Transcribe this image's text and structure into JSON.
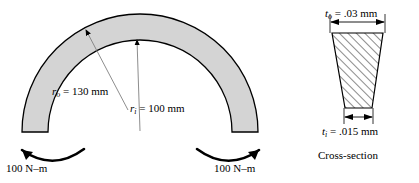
{
  "figure": {
    "colors": {
      "beam_fill": "#d4d4d4",
      "outline": "#000000",
      "leader_line": "#808080",
      "hatch": "#000000"
    }
  },
  "beam": {
    "outer_radius_label": {
      "symbol": "r",
      "subscript": "o",
      "value": "130",
      "unit": "mm",
      "text": "r_o = 130 mm"
    },
    "inner_radius_label": {
      "symbol": "r",
      "subscript": "i",
      "value": "100",
      "unit": "mm",
      "text": "r_i = 100 mm"
    },
    "moment_left": "100 N–m",
    "moment_right": "100 N–m"
  },
  "cross_section": {
    "caption": "Cross-section",
    "top_thickness_label": {
      "symbol": "t",
      "subscript": "o",
      "value": ".03",
      "unit": "mm",
      "text": "t_o = .03 mm"
    },
    "bottom_thickness_label": {
      "symbol": "t",
      "subscript": "i",
      "value": ".015",
      "unit": "mm",
      "text": "t_i = .015 mm"
    }
  },
  "symbols": {
    "r": "r",
    "t": "t",
    "sub_o": "o",
    "sub_i": "i",
    "eq_ro": "= 130 mm",
    "eq_ri": "= 100 mm",
    "eq_to": "= .03 mm",
    "eq_ti": "= .015 mm"
  }
}
